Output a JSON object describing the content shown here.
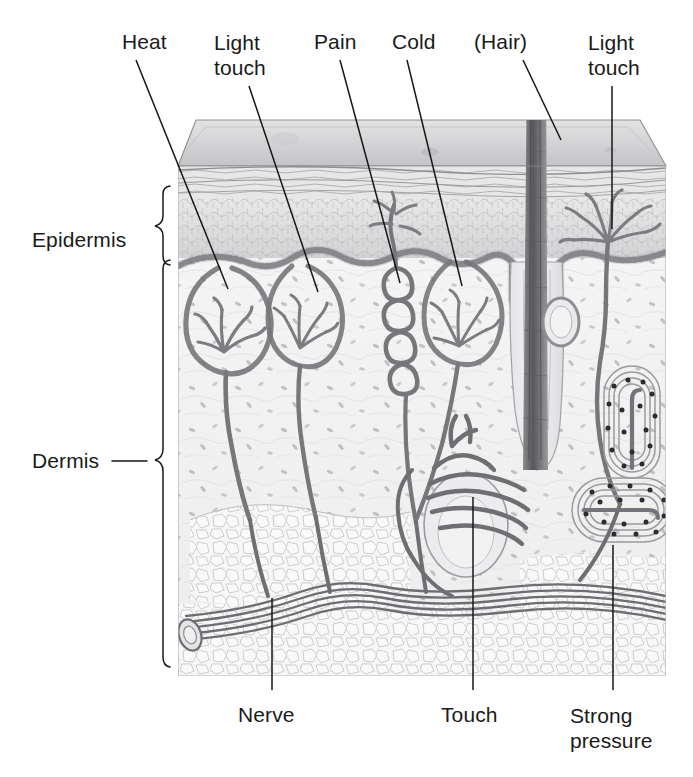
{
  "figure": {
    "type": "anatomical-illustration",
    "medium": "pencil drawing, grayscale"
  },
  "labels": {
    "top": [
      {
        "id": "heat",
        "text": "Heat",
        "x": 122,
        "y": 30
      },
      {
        "id": "light-touch-1",
        "text": "Light\ntouch",
        "x": 214,
        "y": 30
      },
      {
        "id": "pain",
        "text": "Pain",
        "x": 314,
        "y": 30
      },
      {
        "id": "cold",
        "text": "Cold",
        "x": 392,
        "y": 30
      },
      {
        "id": "hair",
        "text": "(Hair)",
        "x": 474,
        "y": 30
      },
      {
        "id": "light-touch-2",
        "text": "Light\ntouch",
        "x": 588,
        "y": 30
      }
    ],
    "left": [
      {
        "id": "epidermis",
        "text": "Epidermis",
        "x": 32,
        "y": 228
      },
      {
        "id": "dermis",
        "text": "Dermis",
        "x": 32,
        "y": 461
      }
    ],
    "bottom": [
      {
        "id": "nerve",
        "text": "Nerve",
        "x": 238,
        "y": 703
      },
      {
        "id": "touch",
        "text": "Touch",
        "x": 441,
        "y": 703
      },
      {
        "id": "strong-pressure",
        "text": "Strong\npressure",
        "x": 570,
        "y": 703
      }
    ]
  },
  "leaders": [
    {
      "id": "leader-heat",
      "from": [
        136,
        60
      ],
      "to": [
        228,
        289
      ]
    },
    {
      "id": "leader-light-touch-1",
      "from": [
        249,
        86
      ],
      "to": [
        318,
        292
      ]
    },
    {
      "id": "leader-pain",
      "from": [
        340,
        60
      ],
      "to": [
        400,
        283
      ]
    },
    {
      "id": "leader-cold",
      "from": [
        407,
        60
      ],
      "to": [
        462,
        286
      ]
    },
    {
      "id": "leader-hair",
      "from": [
        523,
        60
      ],
      "to": [
        561,
        140
      ]
    },
    {
      "id": "leader-light-touch-2",
      "from": [
        612,
        86
      ],
      "to": [
        612,
        229
      ]
    },
    {
      "id": "leader-nerve",
      "from": [
        272,
        690
      ],
      "to": [
        272,
        598
      ]
    },
    {
      "id": "leader-touch",
      "from": [
        473,
        690
      ],
      "to": [
        473,
        497
      ]
    },
    {
      "id": "leader-strong-press",
      "from": [
        613,
        690
      ],
      "to": [
        613,
        545
      ]
    }
  ],
  "braces": {
    "epidermis": {
      "top": 185,
      "bottom": 258,
      "x": 172
    },
    "dermis": {
      "top": 258,
      "bottom": 676,
      "x": 172
    }
  },
  "block": {
    "left": 178,
    "right": 666,
    "top": 120,
    "bottom": 676,
    "top_face_back_left": 196,
    "top_face_back_right": 640,
    "surface_y": 166
  },
  "structures": [
    {
      "id": "epidermis-layer",
      "label": "Epidermis",
      "note": "stratified cellular band below surface"
    },
    {
      "id": "basal-layer",
      "label": "Basal cell layer",
      "note": "beaded row at epidermis/dermis boundary"
    },
    {
      "id": "dermis-layer",
      "label": "Dermis",
      "note": "pale fibrous tissue with scattered nuclei"
    },
    {
      "id": "adipose-layer",
      "label": "Subcutaneous fat",
      "note": "polygonal fat cells at base"
    },
    {
      "id": "heat-receptor",
      "label": "Heat receptor",
      "note": "encapsulated bulb, left-most"
    },
    {
      "id": "light-touch-bulb-1",
      "label": "Light touch receptor",
      "note": "Meissner-type bulb"
    },
    {
      "id": "pain-receptor",
      "label": "Pain receptor",
      "note": "coiled free nerve ending"
    },
    {
      "id": "cold-receptor",
      "label": "Cold receptor",
      "note": "encapsulated bulb"
    },
    {
      "id": "hair-shaft",
      "label": "Hair shaft",
      "note": "dark shaft through follicle"
    },
    {
      "id": "hair-follicle",
      "label": "Hair follicle",
      "note": "with sebaceous gland bulb"
    },
    {
      "id": "touch-receptor",
      "label": "Touch receptor",
      "note": "nerve plexus around follicle"
    },
    {
      "id": "light-touch-bulb-2",
      "label": "Light touch receptor",
      "note": "branched free ending, right"
    },
    {
      "id": "pacinian-upper",
      "label": "Pacinian corpuscle",
      "note": "lamellated, strong pressure"
    },
    {
      "id": "pacinian-lower",
      "label": "Pacinian corpuscle",
      "note": "lamellated, strong pressure"
    },
    {
      "id": "nerve-bundle",
      "label": "Nerve",
      "note": "multi-strand trunk at base"
    }
  ],
  "colors": {
    "ink": "#1a1a1a",
    "pencil_dark": "#6e6e72",
    "pencil_mid": "#9a9a9e",
    "pencil_light": "#c8c8cc",
    "epidermis_fill": "#dcdcdc",
    "dermis_fill": "#f0f0f0",
    "fat_fill": "#f6f6f6",
    "surface_fill": "#cfcfd1",
    "background": "#ffffff"
  }
}
